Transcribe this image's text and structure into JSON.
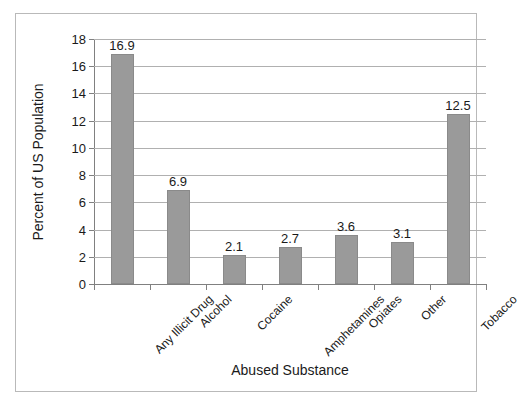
{
  "chart_data": {
    "type": "bar",
    "title": "",
    "xlabel": "Abused Substance",
    "ylabel": "Percent of US Population",
    "categories": [
      "Any Illicit Drug",
      "Alcohol",
      "Cocaine",
      "Amphetamines",
      "Opiates",
      "Other",
      "Tobacco"
    ],
    "values": [
      16.9,
      6.9,
      2.1,
      2.7,
      3.6,
      3.1,
      12.5
    ],
    "value_labels": [
      "16.9",
      "6.9",
      "2.1",
      "2.7",
      "3.6",
      "3.1",
      "12.5"
    ],
    "ylim": [
      0,
      18
    ],
    "ytick_step": 2,
    "ytick_labels": [
      "0",
      "2",
      "4",
      "6",
      "8",
      "10",
      "12",
      "14",
      "16",
      "18"
    ],
    "grid": "horizontal",
    "legend": "none",
    "series_name": "Percent of US Population",
    "bar_color": "#9a9a9a",
    "grid_color": "#b0b0b0",
    "axis_color": "#808080",
    "text_color": "#1a1a1a",
    "background": "#ffffff"
  }
}
